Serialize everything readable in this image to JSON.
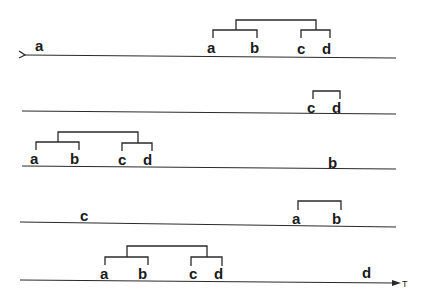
{
  "diagram": {
    "type": "sequence-of-timelines with merge trees",
    "axis_label": "T",
    "rows": [
      {
        "id": "row1",
        "line": {
          "x1": 24,
          "y1": 55,
          "x2": 396,
          "y2": 58
        },
        "start_marker": ">",
        "event": {
          "label": "a",
          "x": 40,
          "y": 48
        },
        "tree": {
          "leaves": [
            {
              "label": "a",
              "x": 213
            },
            {
              "label": "b",
              "x": 257
            },
            {
              "label": "c",
              "x": 301
            },
            {
              "label": "d",
              "x": 329
            }
          ],
          "structure": "((a,b),(c,d))"
        }
      },
      {
        "id": "row2",
        "line": {
          "x1": 22,
          "y1": 111,
          "x2": 396,
          "y2": 114
        },
        "tree": {
          "leaves": [
            {
              "label": "c",
              "x": 313
            },
            {
              "label": "d",
              "x": 339
            }
          ],
          "structure": "(c,d)"
        }
      },
      {
        "id": "row3",
        "line": {
          "x1": 22,
          "y1": 166,
          "x2": 396,
          "y2": 169
        },
        "event": {
          "label": "b",
          "x": 334,
          "y": 166
        },
        "tree": {
          "leaves": [
            {
              "label": "a",
              "x": 40
            },
            {
              "label": "b",
              "x": 78
            },
            {
              "label": "c",
              "x": 124
            },
            {
              "label": "d",
              "x": 150
            }
          ],
          "structure": "((a,b),(c,d))"
        }
      },
      {
        "id": "row4",
        "line": {
          "x1": 20,
          "y1": 222,
          "x2": 396,
          "y2": 227
        },
        "event": {
          "label": "c",
          "x": 86,
          "y": 219
        },
        "tree": {
          "leaves": [
            {
              "label": "a",
              "x": 302
            },
            {
              "label": "b",
              "x": 341
            }
          ],
          "structure": "(a,b)"
        }
      },
      {
        "id": "row5",
        "line": {
          "x1": 20,
          "y1": 280,
          "x2": 392,
          "y2": 283
        },
        "end_marker": "arrow",
        "event": {
          "label": "d",
          "x": 368,
          "y": 277
        },
        "tree": {
          "leaves": [
            {
              "label": "a",
              "x": 107
            },
            {
              "label": "b",
              "x": 144
            },
            {
              "label": "c",
              "x": 196
            },
            {
              "label": "d",
              "x": 221
            }
          ],
          "structure": "((a,b),(c,d))"
        }
      }
    ]
  }
}
